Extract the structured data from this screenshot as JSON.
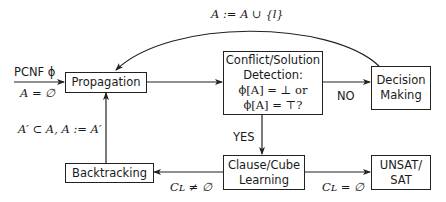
{
  "nodes": {
    "propagation": {
      "label": "Propagation"
    },
    "detection": {
      "lines": [
        "Conflict/Solution",
        "Detection:",
        "ϕ[A] = ⊥ or",
        "ϕ[A] = ⊤?"
      ]
    },
    "decision": {
      "lines": [
        "Decision",
        "Making"
      ]
    },
    "learning": {
      "lines": [
        "Clause/Cube",
        "Learning"
      ]
    },
    "result": {
      "lines": [
        "UNSAT/",
        "SAT"
      ]
    },
    "backtracking": {
      "label": "Backtracking"
    }
  },
  "edge_labels": {
    "input_top": "PCNF ϕ",
    "input_bottom": "A = ∅",
    "decision_loop": "A := A ∪ {l}",
    "no": "NO",
    "yes": "YES",
    "backtrack_update": "A′ ⊂ A, A := A′",
    "learn_nonempty": "Cʟ ≠ ∅",
    "learn_empty": "Cʟ = ∅"
  }
}
